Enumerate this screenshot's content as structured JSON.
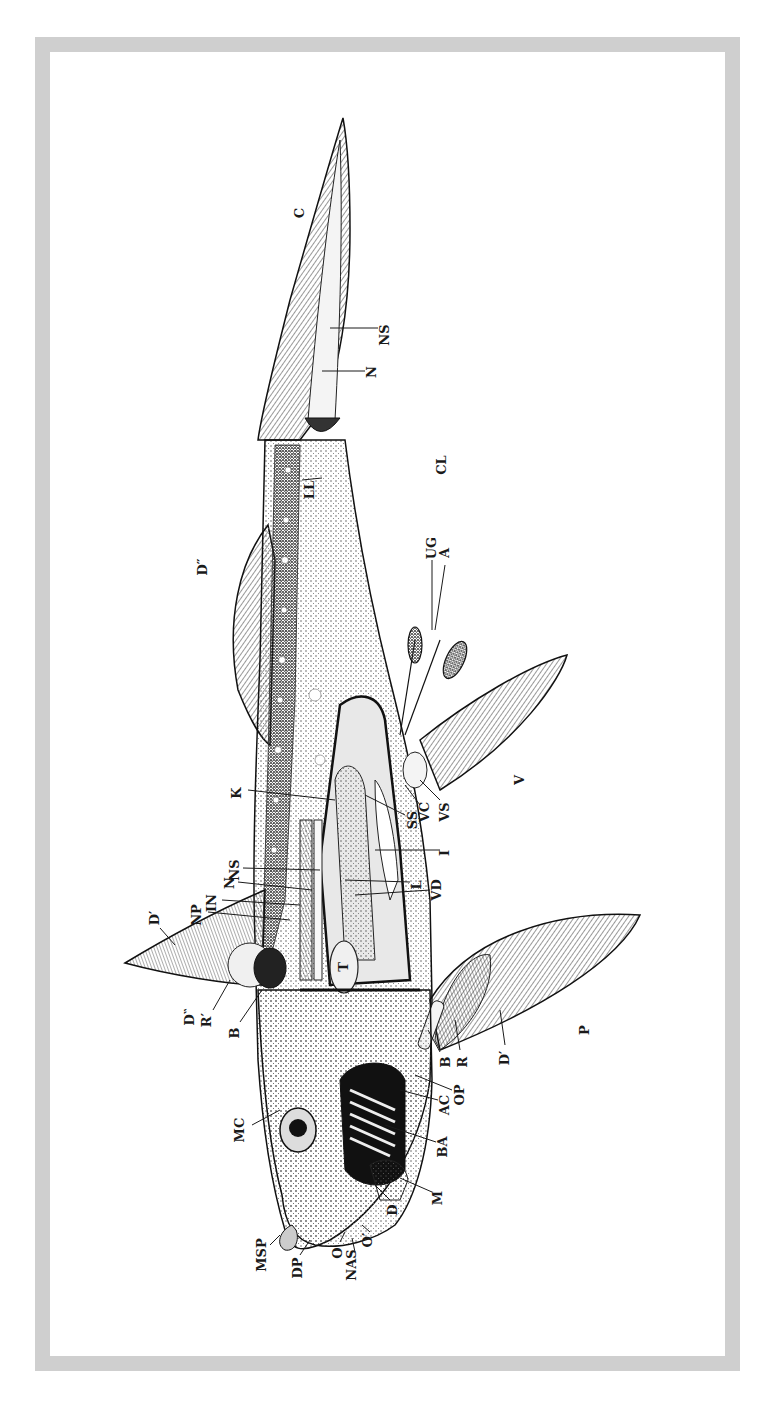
{
  "figure": {
    "orientation": "rotated 90 degrees, tail up, head down",
    "colors": {
      "frame": "#cfcfcf",
      "ink": "#1a1a1a",
      "background": "#ffffff"
    }
  },
  "labels": [
    {
      "id": "C",
      "text": "C"
    },
    {
      "id": "NS_tail",
      "text": "NS"
    },
    {
      "id": "N_tail",
      "text": "N"
    },
    {
      "id": "LL",
      "text": "LL"
    },
    {
      "id": "CL",
      "text": "CL"
    },
    {
      "id": "UG",
      "text": "UG"
    },
    {
      "id": "A",
      "text": "A"
    },
    {
      "id": "D2",
      "text": "D″"
    },
    {
      "id": "K",
      "text": "K"
    },
    {
      "id": "V",
      "text": "V"
    },
    {
      "id": "SS",
      "text": "SS"
    },
    {
      "id": "VC",
      "text": "VC"
    },
    {
      "id": "VS",
      "text": "VS"
    },
    {
      "id": "I",
      "text": "I"
    },
    {
      "id": "NS_body",
      "text": "NS"
    },
    {
      "id": "N_body",
      "text": "N"
    },
    {
      "id": "IN",
      "text": "IN"
    },
    {
      "id": "NP",
      "text": "NP"
    },
    {
      "id": "L",
      "text": "L"
    },
    {
      "id": "VD",
      "text": "VD"
    },
    {
      "id": "D1",
      "text": "D′"
    },
    {
      "id": "T",
      "text": "T"
    },
    {
      "id": "D1b",
      "text": "D‶"
    },
    {
      "id": "R1",
      "text": "R′"
    },
    {
      "id": "B_dorsal",
      "text": "B"
    },
    {
      "id": "B_pect",
      "text": "B"
    },
    {
      "id": "R_pect",
      "text": "R"
    },
    {
      "id": "D1_pect",
      "text": "D′"
    },
    {
      "id": "P",
      "text": "P"
    },
    {
      "id": "OP",
      "text": "OP"
    },
    {
      "id": "AC",
      "text": "AC"
    },
    {
      "id": "BA",
      "text": "BA"
    },
    {
      "id": "MC",
      "text": "MC"
    },
    {
      "id": "M",
      "text": "M"
    },
    {
      "id": "D",
      "text": "D"
    },
    {
      "id": "MSP",
      "text": "MSP"
    },
    {
      "id": "DP",
      "text": "DP"
    },
    {
      "id": "O",
      "text": "O"
    },
    {
      "id": "NAS",
      "text": "NAS"
    },
    {
      "id": "O1",
      "text": "O′"
    }
  ]
}
